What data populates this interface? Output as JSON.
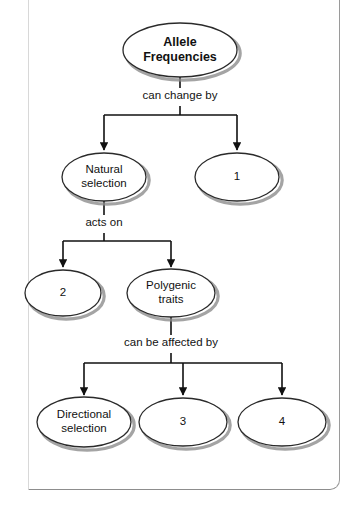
{
  "diagram": {
    "type": "concept-map-flowchart",
    "style": {
      "background": "#ffffff",
      "node_fill": "#ffffff",
      "node_stroke": "#2a2a2a",
      "node_shadow": "#8a8a8a",
      "connector_color": "#111111",
      "frame_color": "#9a9a9a"
    },
    "nodes": [
      {
        "id": "allele-frequencies",
        "label": "Allele\nFrequencies",
        "bold": true,
        "font_size": 12.5,
        "cx": 180,
        "cy": 50,
        "rx": 57,
        "ry": 27,
        "level": 0
      },
      {
        "id": "natural-selection",
        "label": "Natural\nselection",
        "bold": false,
        "font_size": 11.5,
        "cx": 104,
        "cy": 177,
        "rx": 42,
        "ry": 24,
        "level": 1
      },
      {
        "id": "blank-1",
        "label": "1",
        "bold": false,
        "font_size": 11.5,
        "cx": 237,
        "cy": 177,
        "rx": 42,
        "ry": 24,
        "level": 1
      },
      {
        "id": "blank-2",
        "label": "2",
        "bold": false,
        "font_size": 11.5,
        "cx": 63,
        "cy": 293,
        "rx": 38,
        "ry": 23,
        "level": 2
      },
      {
        "id": "polygenic-traits",
        "label": "Polygenic\ntraits",
        "bold": false,
        "font_size": 11.5,
        "cx": 171,
        "cy": 293,
        "rx": 44,
        "ry": 24,
        "level": 2
      },
      {
        "id": "directional-selection",
        "label": "Directional\nselection",
        "bold": false,
        "font_size": 11.5,
        "cx": 84,
        "cy": 422,
        "rx": 47,
        "ry": 25,
        "level": 3
      },
      {
        "id": "blank-3",
        "label": "3",
        "bold": false,
        "font_size": 11.5,
        "cx": 183,
        "cy": 422,
        "rx": 44,
        "ry": 24,
        "level": 3
      },
      {
        "id": "blank-4",
        "label": "4",
        "bold": false,
        "font_size": 11.5,
        "cx": 282,
        "cy": 422,
        "rx": 44,
        "ry": 24,
        "level": 3
      }
    ],
    "edge_labels": [
      {
        "id": "can-change-by",
        "text": "can change by",
        "cx": 180,
        "cy": 97
      },
      {
        "id": "acts-on",
        "text": "acts on",
        "cx": 104,
        "cy": 224
      },
      {
        "id": "can-be-affected-by",
        "text": "can be affected by",
        "cx": 171,
        "cy": 344
      }
    ],
    "connectors": [
      {
        "id": "root-to-label",
        "kind": "line",
        "points": [
          [
            180,
            77
          ],
          [
            180,
            88
          ]
        ]
      },
      {
        "id": "label-to-split",
        "kind": "line",
        "points": [
          [
            180,
            106
          ],
          [
            180,
            115
          ]
        ]
      },
      {
        "id": "split-level1",
        "kind": "polyline-branch",
        "bar_y": 115,
        "from_x": 180,
        "to_x": [
          104,
          237
        ],
        "arrow_y": 150
      },
      {
        "id": "natural-to-label",
        "kind": "line",
        "points": [
          [
            104,
            201
          ],
          [
            104,
            215
          ]
        ]
      },
      {
        "id": "label-to-split2",
        "kind": "line",
        "points": [
          [
            104,
            233
          ],
          [
            104,
            241
          ]
        ]
      },
      {
        "id": "split-level2",
        "kind": "polyline-branch",
        "bar_y": 241,
        "from_x": 104,
        "to_x": [
          63,
          171
        ],
        "arrow_y": 267
      },
      {
        "id": "polygenic-to-label",
        "kind": "line",
        "points": [
          [
            171,
            317
          ],
          [
            171,
            335
          ]
        ]
      },
      {
        "id": "label-to-split3",
        "kind": "line",
        "points": [
          [
            171,
            353
          ],
          [
            171,
            363
          ]
        ]
      },
      {
        "id": "split-level3",
        "kind": "polyline-branch",
        "bar_y": 363,
        "from_x": 171,
        "to_x": [
          84,
          183,
          282
        ],
        "arrow_y": 395
      }
    ]
  }
}
